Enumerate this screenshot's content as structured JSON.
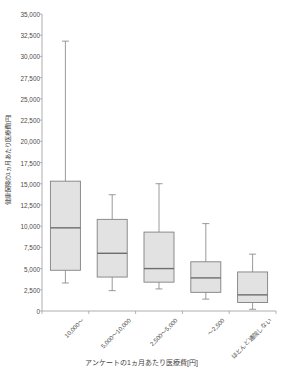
{
  "chart_data": {
    "type": "box",
    "title": "",
    "xlabel": "アンケートの1ヵ月あたり医療費[円]",
    "ylabel": "健康保険の1ヵ月あたり医療費[円]",
    "ylim": [
      0,
      35000
    ],
    "ytick_step": 2500,
    "grid": false,
    "legend": "none",
    "categories": [
      "10,000～",
      "5,000～10,000",
      "2,500～5,000",
      "～2,500",
      "ほとんど通院しない"
    ],
    "ytick_labels": [
      "35,000",
      "32,500",
      "30,000",
      "27,500",
      "25,000",
      "22,500",
      "20,000",
      "17,500",
      "15,000",
      "12,500",
      "10,000",
      "7,500",
      "5,000",
      "2,500",
      "0"
    ],
    "ytick_values": [
      35000,
      32500,
      30000,
      27500,
      25000,
      22500,
      20000,
      17500,
      15000,
      12500,
      10000,
      7500,
      5000,
      2500,
      0
    ],
    "boxes": [
      {
        "category": "10,000～",
        "whisker_high": 31800,
        "q3": 15300,
        "median": 9800,
        "q1": 4800,
        "whisker_low": 3300
      },
      {
        "category": "5,000～10,000",
        "whisker_high": 13700,
        "q3": 10800,
        "median": 6800,
        "q1": 4000,
        "whisker_low": 2400
      },
      {
        "category": "2,500～5,000",
        "whisker_high": 15000,
        "q3": 9300,
        "median": 5000,
        "q1": 3400,
        "whisker_low": 2600
      },
      {
        "category": "～2,500",
        "whisker_high": 10300,
        "q3": 5800,
        "median": 3900,
        "q1": 2200,
        "whisker_low": 1400
      },
      {
        "category": "ほとんど通院しない",
        "whisker_high": 6700,
        "q3": 4600,
        "median": 1900,
        "q1": 1000,
        "whisker_low": 200
      }
    ],
    "colors": {
      "box_fill": "#e2e2e2",
      "box_stroke": "#808080",
      "axis": "#9a9a9a",
      "text": "#3f3f3f",
      "background": "#ffffff"
    }
  }
}
